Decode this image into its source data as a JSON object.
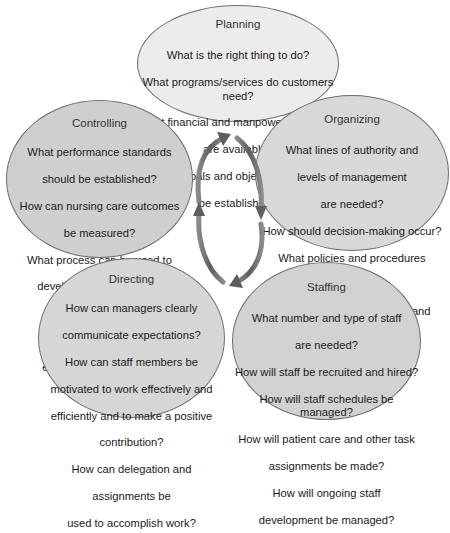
{
  "diagram": {
    "type": "cycle",
    "center_graphic": "circular-arrows-icon",
    "colors": {
      "planning_fill": "#ececec",
      "controlling_fill": "#cfcfcf",
      "organizing_fill": "#d8d8d8",
      "directing_fill": "#d6d6d6",
      "staffing_fill": "#d2d2d2",
      "arrow": "#6a6a6a",
      "border": "#6e6e6e"
    },
    "nodes": {
      "planning": {
        "title": "Planning",
        "questions": [
          "What is the right thing to do?",
          "What programs/services do customers need?",
          "What financial and manpower resources",
          "are available?",
          "What goals and objectives should",
          "be established?"
        ]
      },
      "organizing": {
        "title": "Organizing",
        "questions": [
          "What lines of authority and",
          "levels of management",
          "are needed?",
          "How should decision-making occur?",
          "What policies and procedures",
          "are needed?",
          "How can staff qualifications and",
          "responsibilities be defined?",
          "How should work be",
          "assigned?"
        ]
      },
      "staffing": {
        "title": "Staffing",
        "questions": [
          "What number and type of staff",
          "are needed?",
          "How will staff be recruited and hired?",
          "How will staff schedules be managed?",
          "How will patient care and other task",
          "assignments be made?",
          "How will ongoing staff",
          "development be managed?"
        ]
      },
      "directing": {
        "title": "Directing",
        "questions": [
          "How can managers clearly",
          "communicate expectations?",
          "How can staff members be",
          "motivated to work effectively and",
          "efficiently and to make a positive",
          "contribution?",
          "How can delegation and",
          "assignments be",
          "used to accomplish work?"
        ]
      },
      "controlling": {
        "title": "Controlling",
        "questions": [
          "What performance standards",
          "should be established?",
          "How can nursing care outcomes",
          "be measured?",
          "What process can be used to",
          "develop an action plan to",
          "improve performance?",
          "What are keys to good",
          "employee performance",
          "appraisals?"
        ]
      }
    }
  }
}
